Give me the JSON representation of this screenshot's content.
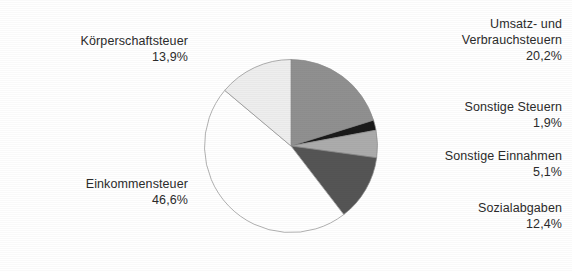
{
  "chart_data": {
    "type": "pie",
    "title": "",
    "subtitle": "",
    "xlabel": "",
    "ylabel": "",
    "legend_position": "none",
    "grid": false,
    "value_suffix": "%",
    "decimal_separator": ",",
    "start_angle_deg": 0,
    "direction": "clockwise",
    "categories": [
      "Umsatz- und Verbrauchsteuern",
      "Sonstige Steuern",
      "Sonstige Einnahmen",
      "Sozialabgaben",
      "Einkommensteuer",
      "Körperschaftsteuer"
    ],
    "values": [
      20.2,
      1.9,
      5.1,
      12.4,
      46.6,
      13.9
    ],
    "value_labels": [
      "20,2%",
      "1,9%",
      "5,1%",
      "12,4%",
      "46,6%",
      "13,9%"
    ],
    "colors": [
      "#909090",
      "#1c1c1c",
      "#ababab",
      "#565656",
      "#ffffff",
      "#ececec"
    ],
    "slice_outline_color": "#8c8c8c",
    "slices": [
      {
        "name": "Umsatz- und Verbrauchsteuern",
        "label_line1": "Umsatz- und",
        "label_line2": "Verbrauchsteuern",
        "value": 20.2,
        "value_label": "20,2%",
        "color": "#909090"
      },
      {
        "name": "Sonstige Steuern",
        "label_line1": "Sonstige Steuern",
        "label_line2": "",
        "value": 1.9,
        "value_label": "1,9%",
        "color": "#1c1c1c"
      },
      {
        "name": "Sonstige Einnahmen",
        "label_line1": "Sonstige Einnahmen",
        "label_line2": "",
        "value": 5.1,
        "value_label": "5,1%",
        "color": "#ababab"
      },
      {
        "name": "Sozialabgaben",
        "label_line1": "Sozialabgaben",
        "label_line2": "",
        "value": 12.4,
        "value_label": "12,4%",
        "color": "#565656"
      },
      {
        "name": "Einkommensteuer",
        "label_line1": "Einkommensteuer",
        "label_line2": "",
        "value": 46.6,
        "value_label": "46,6%",
        "color": "#ffffff"
      },
      {
        "name": "Körperschaftsteuer",
        "label_line1": "Körperschaftsteuer",
        "label_line2": "",
        "value": 13.9,
        "value_label": "13,9%",
        "color": "#ececec"
      }
    ]
  },
  "labels": {
    "koerperschaftsteuer": {
      "line1": "Körperschaftsteuer",
      "value": "13,9%"
    },
    "umsatz_verbrauchsteuern": {
      "line1": "Umsatz- und",
      "line2": "Verbrauchsteuern",
      "value": "20,2%"
    },
    "sonstige_steuern": {
      "line1": "Sonstige Steuern",
      "value": "1,9%"
    },
    "sonstige_einnahmen": {
      "line1": "Sonstige Einnahmen",
      "value": "5,1%"
    },
    "sozialabgaben": {
      "line1": "Sozialabgaben",
      "value": "12,4%"
    },
    "einkommensteuer": {
      "line1": "Einkommensteuer",
      "value": "46,6%"
    }
  }
}
